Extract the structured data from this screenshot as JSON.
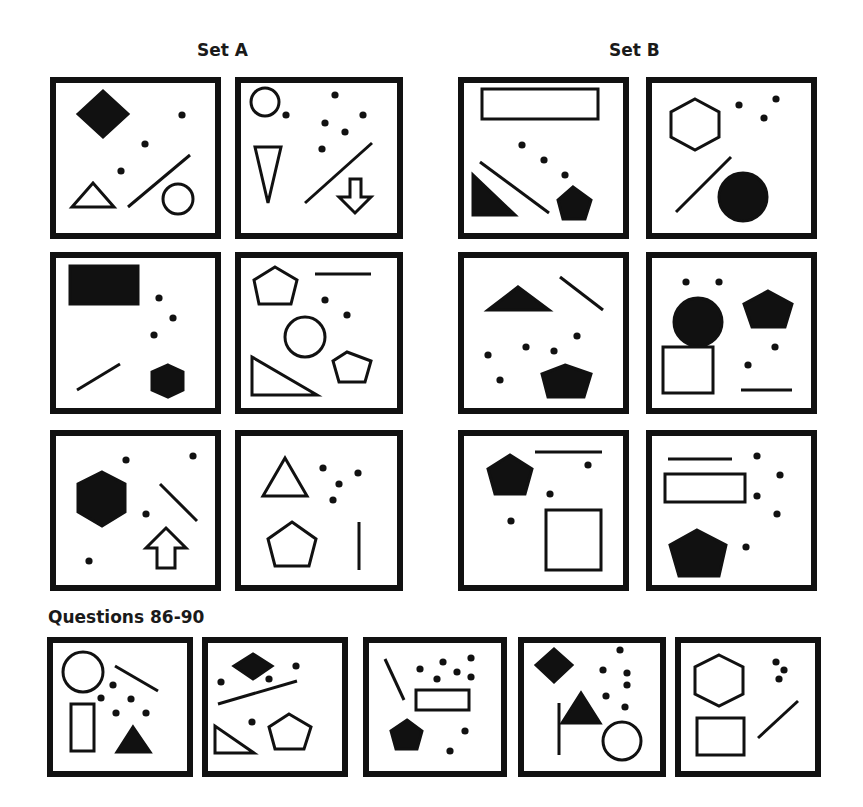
{
  "titles": {
    "set_a": "Set A",
    "set_b": "Set B",
    "questions": "Questions 86-90"
  },
  "colors": {
    "ink": "#111111",
    "background": "#ffffff"
  },
  "panels": [
    {
      "id": "set-a-1",
      "group": "Set A",
      "x": 50,
      "y": 77,
      "w": 171,
      "h": 162,
      "shapes": [
        {
          "t": "poly",
          "fill": true,
          "pts": "28,37 53,14 78,37 53,60"
        },
        {
          "t": "dot",
          "x": 132,
          "y": 38
        },
        {
          "t": "dot",
          "x": 95,
          "y": 67
        },
        {
          "t": "dot",
          "x": 71,
          "y": 94
        },
        {
          "t": "poly",
          "fill": false,
          "pts": "22,130 43,106 64,130"
        },
        {
          "t": "line",
          "x1": 78,
          "y1": 130,
          "x2": 140,
          "y2": 78
        },
        {
          "t": "circle",
          "fill": false,
          "cx": 128,
          "cy": 122,
          "r": 15
        }
      ]
    },
    {
      "id": "set-a-2",
      "group": "Set A",
      "x": 235,
      "y": 77,
      "w": 168,
      "h": 162,
      "shapes": [
        {
          "t": "circle",
          "fill": false,
          "cx": 30,
          "cy": 25,
          "r": 14
        },
        {
          "t": "dot",
          "x": 51,
          "y": 38
        },
        {
          "t": "dot",
          "x": 100,
          "y": 18
        },
        {
          "t": "dot",
          "x": 128,
          "y": 38
        },
        {
          "t": "dot",
          "x": 90,
          "y": 46
        },
        {
          "t": "dot",
          "x": 110,
          "y": 55
        },
        {
          "t": "dot",
          "x": 87,
          "y": 72
        },
        {
          "t": "poly",
          "fill": false,
          "pts": "20,70 46,70 33,126"
        },
        {
          "t": "line",
          "x1": 70,
          "y1": 126,
          "x2": 137,
          "y2": 66
        },
        {
          "t": "poly",
          "fill": false,
          "pts": "115,102 126,102 126,120 136,120 120,136 104,120 115,120"
        }
      ]
    },
    {
      "id": "set-b-1",
      "group": "Set B",
      "x": 458,
      "y": 77,
      "w": 171,
      "h": 162,
      "shapes": [
        {
          "t": "rect",
          "fill": false,
          "x": 24,
          "y": 12,
          "w": 116,
          "h": 30
        },
        {
          "t": "dot",
          "x": 64,
          "y": 68
        },
        {
          "t": "dot",
          "x": 86,
          "y": 83
        },
        {
          "t": "dot",
          "x": 107,
          "y": 98
        },
        {
          "t": "line",
          "x1": 22,
          "y1": 85,
          "x2": 91,
          "y2": 136
        },
        {
          "t": "poly",
          "fill": true,
          "pts": "15,98 15,138 57,138"
        },
        {
          "t": "poly",
          "fill": true,
          "pts": "115,110 133,123 127,142 105,142 100,123"
        }
      ]
    },
    {
      "id": "set-b-2",
      "group": "Set B",
      "x": 646,
      "y": 77,
      "w": 171,
      "h": 162,
      "shapes": [
        {
          "t": "poly",
          "fill": false,
          "pts": "49,22 73,35 73,60 49,73 25,60 25,35"
        },
        {
          "t": "dot",
          "x": 93,
          "y": 28
        },
        {
          "t": "dot",
          "x": 130,
          "y": 22
        },
        {
          "t": "dot",
          "x": 118,
          "y": 41
        },
        {
          "t": "line",
          "x1": 30,
          "y1": 135,
          "x2": 85,
          "y2": 80
        },
        {
          "t": "circle",
          "fill": true,
          "cx": 97,
          "cy": 120,
          "r": 24
        }
      ]
    },
    {
      "id": "set-a-3",
      "group": "Set A",
      "x": 50,
      "y": 252,
      "w": 171,
      "h": 162,
      "shapes": [
        {
          "t": "rect",
          "fill": true,
          "x": 20,
          "y": 14,
          "w": 68,
          "h": 38
        },
        {
          "t": "dot",
          "x": 109,
          "y": 46
        },
        {
          "t": "dot",
          "x": 123,
          "y": 66
        },
        {
          "t": "dot",
          "x": 104,
          "y": 83
        },
        {
          "t": "line",
          "x1": 27,
          "y1": 138,
          "x2": 70,
          "y2": 112
        },
        {
          "t": "poly",
          "fill": true,
          "pts": "118,113 133,120 133,138 118,145 102,138 102,120"
        }
      ]
    },
    {
      "id": "set-a-4",
      "group": "Set A",
      "x": 235,
      "y": 252,
      "w": 168,
      "h": 162,
      "shapes": [
        {
          "t": "poly",
          "fill": false,
          "pts": "40,15 62,28 56,52 24,52 19,28"
        },
        {
          "t": "line",
          "x1": 80,
          "y1": 22,
          "x2": 136,
          "y2": 22
        },
        {
          "t": "dot",
          "x": 90,
          "y": 48
        },
        {
          "t": "dot",
          "x": 112,
          "y": 63
        },
        {
          "t": "circle",
          "fill": false,
          "cx": 70,
          "cy": 85,
          "r": 20
        },
        {
          "t": "poly",
          "fill": false,
          "pts": "112,100 136,109 130,130 104,130 98,109"
        },
        {
          "t": "poly",
          "fill": false,
          "pts": "17,105 17,143 82,143"
        }
      ]
    },
    {
      "id": "set-b-3",
      "group": "Set B",
      "x": 458,
      "y": 252,
      "w": 171,
      "h": 162,
      "shapes": [
        {
          "t": "poly",
          "fill": true,
          "pts": "30,58 60,35 91,58"
        },
        {
          "t": "line",
          "x1": 102,
          "y1": 25,
          "x2": 145,
          "y2": 58
        },
        {
          "t": "dot",
          "x": 119,
          "y": 84
        },
        {
          "t": "dot",
          "x": 30,
          "y": 103
        },
        {
          "t": "dot",
          "x": 68,
          "y": 95
        },
        {
          "t": "dot",
          "x": 96,
          "y": 99
        },
        {
          "t": "dot",
          "x": 42,
          "y": 128
        },
        {
          "t": "poly",
          "fill": true,
          "pts": "107,113 133,122 126,145 90,145 84,122"
        }
      ]
    },
    {
      "id": "set-b-4",
      "group": "Set B",
      "x": 646,
      "y": 252,
      "w": 171,
      "h": 162,
      "shapes": [
        {
          "t": "dot",
          "x": 40,
          "y": 30
        },
        {
          "t": "dot",
          "x": 73,
          "y": 30
        },
        {
          "t": "circle",
          "fill": true,
          "cx": 52,
          "cy": 70,
          "r": 24
        },
        {
          "t": "poly",
          "fill": true,
          "pts": "122,39 146,52 139,75 106,75 98,52"
        },
        {
          "t": "rect",
          "fill": false,
          "x": 17,
          "y": 95,
          "w": 50,
          "h": 46
        },
        {
          "t": "dot",
          "x": 129,
          "y": 95
        },
        {
          "t": "dot",
          "x": 102,
          "y": 113
        },
        {
          "t": "line",
          "x1": 95,
          "y1": 138,
          "x2": 146,
          "y2": 138
        }
      ]
    },
    {
      "id": "set-a-5",
      "group": "Set A",
      "x": 50,
      "y": 430,
      "w": 171,
      "h": 161,
      "shapes": [
        {
          "t": "dot",
          "x": 76,
          "y": 30
        },
        {
          "t": "dot",
          "x": 143,
          "y": 26
        },
        {
          "t": "poly",
          "fill": true,
          "pts": "52,42 75,54 75,82 52,96 28,82 28,54"
        },
        {
          "t": "line",
          "x1": 110,
          "y1": 54,
          "x2": 147,
          "y2": 91
        },
        {
          "t": "dot",
          "x": 96,
          "y": 84
        },
        {
          "t": "poly",
          "fill": false,
          "pts": "116,98 136,118 125,118 125,138 107,138 107,118 96,118"
        },
        {
          "t": "dot",
          "x": 39,
          "y": 131
        }
      ]
    },
    {
      "id": "set-a-6",
      "group": "Set A",
      "x": 235,
      "y": 430,
      "w": 168,
      "h": 161,
      "shapes": [
        {
          "t": "poly",
          "fill": false,
          "pts": "50,28 72,66 28,66"
        },
        {
          "t": "dot",
          "x": 88,
          "y": 38
        },
        {
          "t": "dot",
          "x": 123,
          "y": 43
        },
        {
          "t": "dot",
          "x": 104,
          "y": 54
        },
        {
          "t": "dot",
          "x": 98,
          "y": 70
        },
        {
          "t": "poly",
          "fill": false,
          "pts": "57,92 81,109 74,136 40,136 33,109"
        },
        {
          "t": "line",
          "x1": 124,
          "y1": 92,
          "x2": 124,
          "y2": 140
        }
      ]
    },
    {
      "id": "set-b-5",
      "group": "Set B",
      "x": 458,
      "y": 430,
      "w": 171,
      "h": 161,
      "shapes": [
        {
          "t": "line",
          "x1": 77,
          "y1": 22,
          "x2": 144,
          "y2": 22
        },
        {
          "t": "poly",
          "fill": true,
          "pts": "52,25 74,39 67,64 37,64 30,39"
        },
        {
          "t": "dot",
          "x": 130,
          "y": 35
        },
        {
          "t": "dot",
          "x": 92,
          "y": 64
        },
        {
          "t": "dot",
          "x": 53,
          "y": 91
        },
        {
          "t": "rect",
          "fill": false,
          "x": 88,
          "y": 80,
          "w": 55,
          "h": 60
        }
      ]
    },
    {
      "id": "set-b-6",
      "group": "Set B",
      "x": 646,
      "y": 430,
      "w": 171,
      "h": 161,
      "shapes": [
        {
          "t": "line",
          "x1": 22,
          "y1": 29,
          "x2": 86,
          "y2": 29
        },
        {
          "t": "dot",
          "x": 111,
          "y": 26
        },
        {
          "t": "dot",
          "x": 134,
          "y": 45
        },
        {
          "t": "rect",
          "fill": false,
          "x": 19,
          "y": 44,
          "w": 80,
          "h": 28
        },
        {
          "t": "dot",
          "x": 111,
          "y": 66
        },
        {
          "t": "dot",
          "x": 131,
          "y": 84
        },
        {
          "t": "poly",
          "fill": true,
          "pts": "51,100 80,115 73,146 33,146 24,115"
        },
        {
          "t": "dot",
          "x": 100,
          "y": 117
        }
      ]
    },
    {
      "id": "q-86",
      "group": "Questions",
      "x": 47,
      "y": 637,
      "w": 146,
      "h": 140,
      "shapes": [
        {
          "t": "circle",
          "fill": false,
          "cx": 36,
          "cy": 35,
          "r": 20
        },
        {
          "t": "line",
          "x1": 68,
          "y1": 29,
          "x2": 111,
          "y2": 54
        },
        {
          "t": "dot",
          "x": 66,
          "y": 48
        },
        {
          "t": "dot",
          "x": 54,
          "y": 61
        },
        {
          "t": "dot",
          "x": 84,
          "y": 62
        },
        {
          "t": "dot",
          "x": 69,
          "y": 76
        },
        {
          "t": "dot",
          "x": 99,
          "y": 76
        },
        {
          "t": "rect",
          "fill": false,
          "x": 24,
          "y": 67,
          "w": 23,
          "h": 47
        },
        {
          "t": "poly",
          "fill": true,
          "pts": "86,90 103,115 70,115"
        }
      ]
    },
    {
      "id": "q-87",
      "group": "Questions",
      "x": 202,
      "y": 637,
      "w": 146,
      "h": 140,
      "shapes": [
        {
          "t": "poly",
          "fill": true,
          "pts": "32,29 51,17 70,29 51,42"
        },
        {
          "t": "dot",
          "x": 19,
          "y": 45
        },
        {
          "t": "dot",
          "x": 67,
          "y": 42
        },
        {
          "t": "dot",
          "x": 94,
          "y": 29
        },
        {
          "t": "line",
          "x1": 16,
          "y1": 67,
          "x2": 95,
          "y2": 44
        },
        {
          "t": "dot",
          "x": 50,
          "y": 85
        },
        {
          "t": "poly",
          "fill": false,
          "pts": "13,89 13,116 52,116"
        },
        {
          "t": "poly",
          "fill": false,
          "pts": "87,77 109,90 102,112 73,112 67,90"
        }
      ]
    },
    {
      "id": "q-88",
      "group": "Questions",
      "x": 363,
      "y": 637,
      "w": 144,
      "h": 140,
      "shapes": [
        {
          "t": "line",
          "x1": 22,
          "y1": 22,
          "x2": 41,
          "y2": 63
        },
        {
          "t": "dot",
          "x": 57,
          "y": 32
        },
        {
          "t": "dot",
          "x": 80,
          "y": 25
        },
        {
          "t": "dot",
          "x": 108,
          "y": 21
        },
        {
          "t": "dot",
          "x": 94,
          "y": 35
        },
        {
          "t": "dot",
          "x": 74,
          "y": 42
        },
        {
          "t": "dot",
          "x": 108,
          "y": 40
        },
        {
          "t": "rect",
          "fill": false,
          "x": 53,
          "y": 53,
          "w": 53,
          "h": 20
        },
        {
          "t": "poly",
          "fill": true,
          "pts": "44,83 59,94 54,112 33,112 28,94"
        },
        {
          "t": "dot",
          "x": 102,
          "y": 94
        },
        {
          "t": "dot",
          "x": 87,
          "y": 114
        }
      ]
    },
    {
      "id": "q-89",
      "group": "Questions",
      "x": 518,
      "y": 637,
      "w": 148,
      "h": 140,
      "shapes": [
        {
          "t": "poly",
          "fill": true,
          "pts": "18,28 36,12 54,28 36,45"
        },
        {
          "t": "dot",
          "x": 102,
          "y": 13
        },
        {
          "t": "dot",
          "x": 85,
          "y": 33
        },
        {
          "t": "dot",
          "x": 109,
          "y": 36
        },
        {
          "t": "dot",
          "x": 109,
          "y": 48
        },
        {
          "t": "dot",
          "x": 88,
          "y": 59
        },
        {
          "t": "dot",
          "x": 107,
          "y": 70
        },
        {
          "t": "line",
          "x1": 41,
          "y1": 66,
          "x2": 41,
          "y2": 118
        },
        {
          "t": "poly",
          "fill": true,
          "pts": "63,56 82,86 44,86"
        },
        {
          "t": "circle",
          "fill": false,
          "cx": 104,
          "cy": 104,
          "r": 19
        }
      ]
    },
    {
      "id": "q-90",
      "group": "Questions",
      "x": 675,
      "y": 637,
      "w": 146,
      "h": 140,
      "shapes": [
        {
          "t": "poly",
          "fill": false,
          "pts": "44,18 68,30 68,57 44,69 20,57 20,30"
        },
        {
          "t": "dot",
          "x": 101,
          "y": 25
        },
        {
          "t": "dot",
          "x": 109,
          "y": 33
        },
        {
          "t": "dot",
          "x": 104,
          "y": 42
        },
        {
          "t": "rect",
          "fill": false,
          "x": 22,
          "y": 81,
          "w": 47,
          "h": 37
        },
        {
          "t": "line",
          "x1": 83,
          "y1": 101,
          "x2": 123,
          "y2": 64
        }
      ]
    }
  ]
}
